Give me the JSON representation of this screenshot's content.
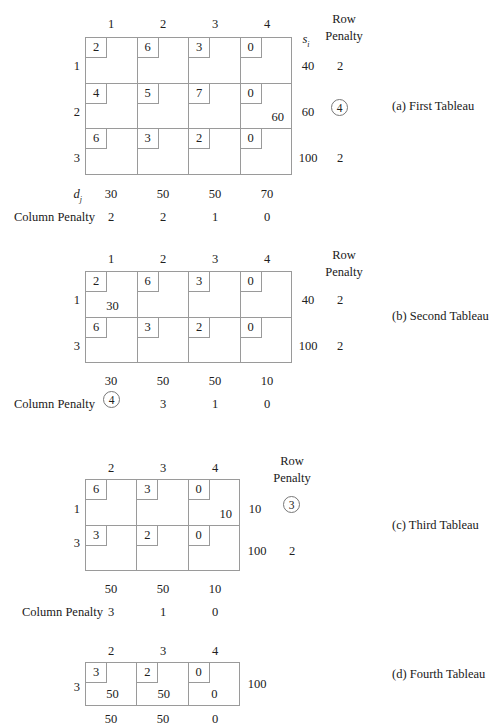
{
  "figure": {
    "caption_a": "(a) First Tableau",
    "caption_b": "(b) Second Tableau",
    "caption_c": "(c) Third Tableau",
    "caption_d": "(d) Fourth Tableau",
    "row_penalty_label_line1": "Row",
    "row_penalty_label_line2": "Penalty",
    "column_penalty_label": "Column Penalty",
    "supply_symbol": "s",
    "supply_symbol_sub": "i",
    "demand_symbol": "d",
    "demand_symbol_sub": "j"
  },
  "tableau_a": {
    "col_headers": [
      "1",
      "2",
      "3",
      "4"
    ],
    "row_headers": [
      "1",
      "2",
      "3"
    ],
    "costs": [
      [
        "2",
        "6",
        "3",
        "0"
      ],
      [
        "4",
        "5",
        "7",
        "0"
      ],
      [
        "6",
        "3",
        "2",
        "0"
      ]
    ],
    "allocations": [
      [
        "",
        "",
        "",
        ""
      ],
      [
        "",
        "",
        "",
        "60"
      ],
      [
        "",
        "",
        "",
        ""
      ]
    ],
    "supply": [
      "40",
      "60",
      "100"
    ],
    "row_penalty": [
      "2",
      "4",
      "2"
    ],
    "row_penalty_circled_index": 1,
    "demand": [
      "30",
      "50",
      "50",
      "70"
    ],
    "column_penalty": [
      "2",
      "2",
      "1",
      "0"
    ],
    "column_penalty_circled_index": -1
  },
  "tableau_b": {
    "col_headers": [
      "1",
      "2",
      "3",
      "4"
    ],
    "row_headers": [
      "1",
      "3"
    ],
    "costs": [
      [
        "2",
        "6",
        "3",
        "0"
      ],
      [
        "6",
        "3",
        "2",
        "0"
      ]
    ],
    "allocations": [
      [
        "30",
        "",
        "",
        ""
      ],
      [
        "",
        "",
        "",
        ""
      ]
    ],
    "supply": [
      "40",
      "100"
    ],
    "row_penalty": [
      "2",
      "2"
    ],
    "row_penalty_circled_index": -1,
    "demand": [
      "30",
      "50",
      "50",
      "10"
    ],
    "column_penalty": [
      "4",
      "3",
      "1",
      "0"
    ],
    "column_penalty_circled_index": 0
  },
  "tableau_c": {
    "col_headers": [
      "2",
      "3",
      "4"
    ],
    "row_headers": [
      "1",
      "3"
    ],
    "costs": [
      [
        "6",
        "3",
        "0"
      ],
      [
        "3",
        "2",
        "0"
      ]
    ],
    "allocations": [
      [
        "",
        "",
        "10"
      ],
      [
        "",
        "",
        ""
      ]
    ],
    "supply": [
      "10",
      "100"
    ],
    "row_penalty": [
      "3",
      "2"
    ],
    "row_penalty_circled_index": 0,
    "demand": [
      "50",
      "50",
      "10"
    ],
    "column_penalty": [
      "3",
      "1",
      "0"
    ],
    "column_penalty_circled_index": -1
  },
  "tableau_d": {
    "col_headers": [
      "2",
      "3",
      "4"
    ],
    "row_headers": [
      "3"
    ],
    "costs": [
      [
        "3",
        "2",
        "0"
      ]
    ],
    "allocations": [
      [
        "50",
        "50",
        "0"
      ]
    ],
    "supply": [
      "100"
    ],
    "demand": [
      "50",
      "50",
      "0"
    ]
  }
}
